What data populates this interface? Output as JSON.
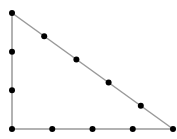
{
  "diagram": {
    "type": "right-triangle-with-points",
    "colors": {
      "background": "#ffffff",
      "edge": "#999999",
      "point": "#000000"
    },
    "edge_width": 1.5,
    "point_radius": 3,
    "vertices": [
      {
        "id": "top",
        "x": 12,
        "y": 13
      },
      {
        "id": "bottom-left",
        "x": 12,
        "y": 129
      },
      {
        "id": "bottom-right",
        "x": 173,
        "y": 129
      }
    ],
    "edges": [
      {
        "id": "left-edge",
        "from": "top",
        "to": "bottom-left",
        "segments": 3
      },
      {
        "id": "bottom-edge",
        "from": "bottom-left",
        "to": "bottom-right",
        "segments": 4
      },
      {
        "id": "hypotenuse",
        "from": "top",
        "to": "bottom-right",
        "segments": 5
      }
    ],
    "point_count": 12
  }
}
